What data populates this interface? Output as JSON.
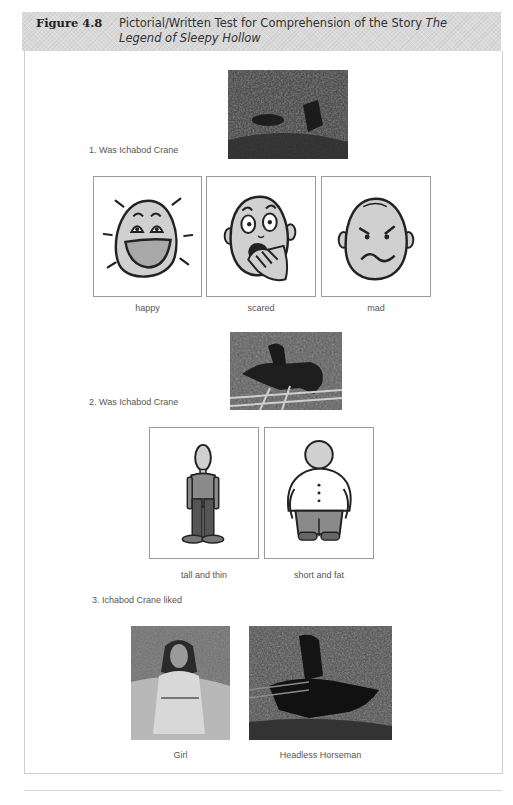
{
  "header": {
    "figure_label": "Figure 4.8",
    "title_plain": "Pictorial/Written Test for Comprehension of the Story ",
    "title_italic": "The Legend of Sleepy Hollow"
  },
  "questions": [
    {
      "number": "1.",
      "text": "1. Was Ichabod Crane",
      "image": "dark-forest-illustration",
      "options": [
        {
          "label": "happy",
          "icon": "happy-face-icon"
        },
        {
          "label": "scared",
          "icon": "scared-face-icon"
        },
        {
          "label": "mad",
          "icon": "mad-face-icon"
        }
      ]
    },
    {
      "number": "2.",
      "text": "2. Was Ichabod Crane",
      "image": "horse-rider-illustration",
      "options": [
        {
          "label": "tall and thin",
          "icon": "tall-thin-figure-icon"
        },
        {
          "label": "short and fat",
          "icon": "short-fat-figure-icon"
        }
      ]
    },
    {
      "number": "3.",
      "text": "3. Ichabod Crane liked",
      "options": [
        {
          "label": "Girl",
          "image": "girl-portrait"
        },
        {
          "label": "Headless Horseman",
          "image": "headless-horseman-illustration"
        }
      ]
    }
  ],
  "colors": {
    "header_band": "#d9d9d9",
    "face_fill": "#d0d0d0",
    "outline": "#222222",
    "card_border": "#9a9a9a"
  }
}
